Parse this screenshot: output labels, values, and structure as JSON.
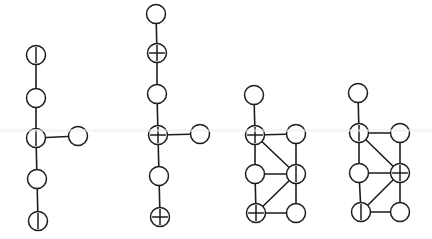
{
  "figure": {
    "background_color": "#ffffff",
    "line_color": "#1d1d1d",
    "node_fill_color": "#ffffff",
    "node_radius": 9.5,
    "mark_legend": {
      "plain": "empty circle (no mark)",
      "bar": "vertical bar mark",
      "plus": "plus sign mark"
    },
    "graphs": [
      {
        "id": "graph-1",
        "label": "graph-1",
        "shape": "cross-tree",
        "nodes": [
          {
            "id": "g1n1",
            "name": "node-top",
            "x": 36,
            "y": 55,
            "mark": "bar"
          },
          {
            "id": "g1n2",
            "name": "node-upper-middle",
            "x": 36,
            "y": 98,
            "mark": "plain"
          },
          {
            "id": "g1n3",
            "name": "node-center",
            "x": 36,
            "y": 138,
            "mark": "bar"
          },
          {
            "id": "g1n4",
            "name": "node-right-branch",
            "x": 78,
            "y": 136,
            "mark": "plain"
          },
          {
            "id": "g1n5",
            "name": "node-lower-middle",
            "x": 37,
            "y": 179,
            "mark": "plain"
          },
          {
            "id": "g1n6",
            "name": "node-bottom",
            "x": 38,
            "y": 221,
            "mark": "bar"
          }
        ],
        "edges": [
          [
            "g1n1",
            "g1n2"
          ],
          [
            "g1n2",
            "g1n3"
          ],
          [
            "g1n3",
            "g1n4"
          ],
          [
            "g1n3",
            "g1n5"
          ],
          [
            "g1n5",
            "g1n6"
          ]
        ]
      },
      {
        "id": "graph-2",
        "label": "graph-2",
        "shape": "cross-tree",
        "nodes": [
          {
            "id": "g2n1",
            "name": "node-top",
            "x": 156,
            "y": 14,
            "mark": "plain"
          },
          {
            "id": "g2n2",
            "name": "node-upper",
            "x": 157,
            "y": 53,
            "mark": "plus"
          },
          {
            "id": "g2n3",
            "name": "node-upper-middle",
            "x": 157,
            "y": 94,
            "mark": "plain"
          },
          {
            "id": "g2n4",
            "name": "node-center",
            "x": 158,
            "y": 135,
            "mark": "plus"
          },
          {
            "id": "g2n5",
            "name": "node-right-branch",
            "x": 200,
            "y": 134,
            "mark": "plain"
          },
          {
            "id": "g2n6",
            "name": "node-lower-middle",
            "x": 159,
            "y": 176,
            "mark": "plain"
          },
          {
            "id": "g2n7",
            "name": "node-bottom",
            "x": 160,
            "y": 217,
            "mark": "plus"
          }
        ],
        "edges": [
          [
            "g2n1",
            "g2n2"
          ],
          [
            "g2n2",
            "g2n3"
          ],
          [
            "g2n3",
            "g2n4"
          ],
          [
            "g2n4",
            "g2n5"
          ],
          [
            "g2n4",
            "g2n6"
          ],
          [
            "g2n6",
            "g2n7"
          ]
        ]
      },
      {
        "id": "graph-3",
        "label": "graph-3",
        "shape": "ladder-with-diagonals",
        "nodes": [
          {
            "id": "g3n1",
            "name": "node-top-stub",
            "x": 254,
            "y": 95,
            "mark": "plain"
          },
          {
            "id": "g3n2",
            "name": "node-upper-left",
            "x": 255,
            "y": 135,
            "mark": "plus"
          },
          {
            "id": "g3n3",
            "name": "node-upper-right",
            "x": 296,
            "y": 134,
            "mark": "plain"
          },
          {
            "id": "g3n4",
            "name": "node-middle-left",
            "x": 255,
            "y": 174,
            "mark": "plain"
          },
          {
            "id": "g3n5",
            "name": "node-middle-right",
            "x": 296,
            "y": 174,
            "mark": "bar"
          },
          {
            "id": "g3n6",
            "name": "node-bottom-left",
            "x": 256,
            "y": 213,
            "mark": "plus"
          },
          {
            "id": "g3n7",
            "name": "node-bottom-right",
            "x": 296,
            "y": 213,
            "mark": "plain"
          }
        ],
        "edges": [
          [
            "g3n1",
            "g3n2"
          ],
          [
            "g3n2",
            "g3n3"
          ],
          [
            "g3n2",
            "g3n4"
          ],
          [
            "g3n2",
            "g3n5"
          ],
          [
            "g3n3",
            "g3n5"
          ],
          [
            "g3n4",
            "g3n5"
          ],
          [
            "g3n4",
            "g3n6"
          ],
          [
            "g3n5",
            "g3n6"
          ],
          [
            "g3n5",
            "g3n7"
          ],
          [
            "g3n6",
            "g3n7"
          ]
        ]
      },
      {
        "id": "graph-4",
        "label": "graph-4",
        "shape": "ladder-with-diagonals",
        "nodes": [
          {
            "id": "g4n1",
            "name": "node-top-stub",
            "x": 358,
            "y": 93,
            "mark": "plain"
          },
          {
            "id": "g4n2",
            "name": "node-upper-left",
            "x": 359,
            "y": 133,
            "mark": "bar"
          },
          {
            "id": "g4n3",
            "name": "node-upper-right",
            "x": 400,
            "y": 133,
            "mark": "plain"
          },
          {
            "id": "g4n4",
            "name": "node-middle-left",
            "x": 359,
            "y": 173,
            "mark": "plain"
          },
          {
            "id": "g4n5",
            "name": "node-middle-right",
            "x": 400,
            "y": 173,
            "mark": "plus"
          },
          {
            "id": "g4n6",
            "name": "node-bottom-left",
            "x": 361,
            "y": 212,
            "mark": "bar"
          },
          {
            "id": "g4n7",
            "name": "node-bottom-right",
            "x": 400,
            "y": 212,
            "mark": "plain"
          }
        ],
        "edges": [
          [
            "g4n1",
            "g4n2"
          ],
          [
            "g4n2",
            "g4n3"
          ],
          [
            "g4n2",
            "g4n4"
          ],
          [
            "g4n2",
            "g4n5"
          ],
          [
            "g4n3",
            "g4n5"
          ],
          [
            "g4n4",
            "g4n5"
          ],
          [
            "g4n4",
            "g4n6"
          ],
          [
            "g4n5",
            "g4n6"
          ],
          [
            "g4n5",
            "g4n7"
          ],
          [
            "g4n6",
            "g4n7"
          ]
        ]
      }
    ]
  }
}
